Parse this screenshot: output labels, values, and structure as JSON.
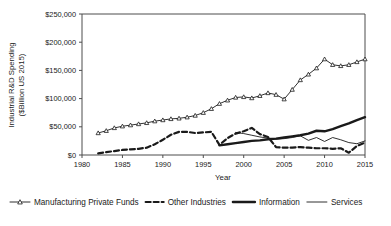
{
  "chart_data": {
    "type": "line",
    "title": "",
    "xlabel": "Year",
    "ylabel": "Industrial R&D Spending ($Billion US 2015)",
    "ylabel_line1": "Industrial R&D Spending",
    "ylabel_line2": "($Billion US 2015)",
    "xlim": [
      1980,
      2015
    ],
    "ylim": [
      0,
      250000
    ],
    "xticks": [
      1980,
      1985,
      1990,
      1995,
      2000,
      2005,
      2010,
      2015
    ],
    "xtick_labels": [
      "1980",
      "1985",
      "1990",
      "1995",
      "2000",
      "2005",
      "2010",
      "2015"
    ],
    "yticks": [
      0,
      50000,
      100000,
      150000,
      200000,
      250000
    ],
    "ytick_labels": [
      "$0",
      "$50,000",
      "$100,000",
      "$150,000",
      "$200,000",
      "$250,000"
    ],
    "grid": false,
    "legend_position": "bottom",
    "series": [
      {
        "name": "Manufacturing Private Funds",
        "style": "solid-thin-marker",
        "marker": "triangle",
        "color": "#1a1a1a",
        "x": [
          1982,
          1983,
          1984,
          1985,
          1986,
          1987,
          1988,
          1989,
          1990,
          1991,
          1992,
          1993,
          1994,
          1995,
          1996,
          1997,
          1998,
          1999,
          2000,
          2001,
          2002,
          2003,
          2004,
          2005,
          2006,
          2007,
          2008,
          2009,
          2010,
          2011,
          2012,
          2013,
          2014,
          2015
        ],
        "values": [
          39000,
          43000,
          48000,
          51000,
          53000,
          55000,
          57000,
          60000,
          62000,
          64000,
          65000,
          67000,
          70000,
          75000,
          82000,
          91000,
          97000,
          102000,
          103000,
          101000,
          105000,
          110000,
          107000,
          99000,
          116000,
          133000,
          143000,
          154000,
          170000,
          160000,
          158000,
          160000,
          165000,
          170000
        ],
        "values_tail": [
          176000,
          186000,
          196000
        ]
      },
      {
        "name": "Other Industries",
        "style": "dashed-thick",
        "color": "#1a1a1a",
        "x": [
          1982,
          1983,
          1984,
          1985,
          1986,
          1987,
          1988,
          1989,
          1990,
          1991,
          1992,
          1993,
          1994,
          1995,
          1996,
          1997,
          1998,
          1999,
          2000,
          2001,
          2002,
          2003,
          2004,
          2005,
          2006,
          2007,
          2008,
          2009,
          2010,
          2011,
          2012,
          2013,
          2014,
          2015
        ],
        "values": [
          3000,
          5000,
          7000,
          9000,
          10000,
          11000,
          13000,
          19000,
          27000,
          36000,
          41000,
          41000,
          39000,
          40000,
          41000,
          18000,
          30000,
          38000,
          42000,
          48000,
          37000,
          32000,
          14000,
          13000,
          13000,
          14000,
          13000,
          12000,
          12000,
          11000,
          12000,
          4000,
          16000,
          22000
        ]
      },
      {
        "name": "Information",
        "style": "solid-thick",
        "color": "#1a1a1a",
        "x": [
          1997,
          1998,
          1999,
          2000,
          2001,
          2002,
          2003,
          2004,
          2005,
          2006,
          2007,
          2008,
          2009,
          2010,
          2011,
          2012,
          2013,
          2014,
          2015
        ],
        "values": [
          17000,
          19000,
          21000,
          23000,
          25000,
          26000,
          28000,
          29000,
          31000,
          33000,
          35000,
          38000,
          43000,
          42000,
          46000,
          51000,
          56000,
          62000,
          67000
        ]
      },
      {
        "name": "Services",
        "style": "solid-thin",
        "color": "#1a1a1a",
        "x": [
          1999,
          2000,
          2001,
          2002,
          2003,
          2004,
          2005,
          2006,
          2007,
          2008,
          2009,
          2010,
          2011,
          2012,
          2013,
          2014,
          2015
        ],
        "values": [
          40000,
          38000,
          35000,
          32000,
          30000,
          28000,
          29000,
          31000,
          34000,
          26000,
          31000,
          24000,
          31000,
          27000,
          22000,
          20000,
          25000
        ]
      }
    ]
  },
  "legend": {
    "items": [
      {
        "label": "Manufacturing Private Funds",
        "key": "manufacturing-private-funds"
      },
      {
        "label": "Other Industries",
        "key": "other-industries"
      },
      {
        "label": "Information",
        "key": "information"
      },
      {
        "label": "Services",
        "key": "services"
      }
    ]
  }
}
